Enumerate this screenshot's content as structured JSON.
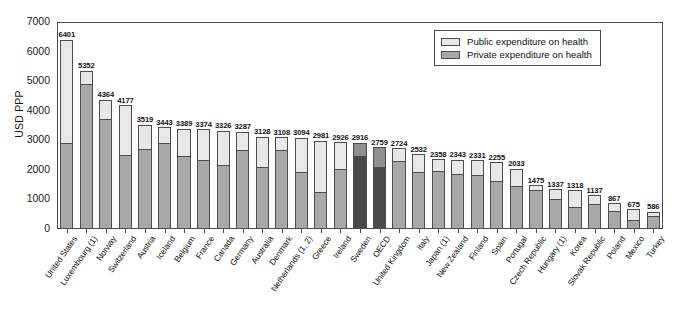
{
  "chart_data": {
    "type": "bar",
    "subtype": "stacked",
    "title": "",
    "xlabel": "",
    "ylabel": "USD PPP",
    "ylim": [
      0,
      7000
    ],
    "yticks": [
      0,
      1000,
      2000,
      3000,
      4000,
      5000,
      6000,
      7000
    ],
    "ytick_labels": [
      "0",
      "1000",
      "2000",
      "3000",
      "4000",
      "5000",
      "6000",
      "7000"
    ],
    "grid": false,
    "legend_position": "top-right",
    "legend": [
      "Public expenditure on health",
      "Private expenditure on health"
    ],
    "colors": {
      "public": "#e8e8e8",
      "private": "#a8a8a8",
      "public_highlight": "#8f8f8f",
      "private_highlight": "#4a4a4a",
      "outline": "#4d4d4d"
    },
    "highlighted_categories": [
      "Sweden",
      "OECD"
    ],
    "categories": [
      "United States",
      "Luxembourg (1)",
      "Norway",
      "Switzerland",
      "Austria",
      "Iceland",
      "Belgium",
      "France",
      "Canada",
      "Germany",
      "Australia",
      "Denmark",
      "Netherlands (1, 2)",
      "Greece",
      "Ireland",
      "Sweden",
      "OECD",
      "United Kingdom",
      "Italy",
      "Japan (1)",
      "New Zealand",
      "Finland",
      "Spain",
      "Portugal",
      "Czech Republic",
      "Hungary (1)",
      "Korea",
      "Slovak Republic",
      "Poland",
      "Mexico",
      "Turkey"
    ],
    "totals": [
      6401,
      5352,
      4364,
      4177,
      3519,
      3443,
      3389,
      3374,
      3326,
      3287,
      3128,
      3108,
      3094,
      2981,
      2926,
      2916,
      2759,
      2724,
      2532,
      2358,
      2343,
      2331,
      2255,
      2033,
      1475,
      1337,
      1318,
      1137,
      867,
      675,
      586
    ],
    "series": [
      {
        "name": "Private expenditure on health",
        "values": [
          2891,
          4867,
          3683,
          2458,
          2671,
          2865,
          2428,
          2311,
          2130,
          2646,
          2053,
          2635,
          1905,
          1204,
          1999,
          2430,
          2066,
          2265,
          1910,
          1925,
          1834,
          1790,
          1576,
          1432,
          1299,
          980,
          709,
          800,
          586,
          279,
          411
        ]
      },
      {
        "name": "Public expenditure on health",
        "values": [
          3510,
          485,
          681,
          1719,
          848,
          578,
          961,
          1063,
          1196,
          641,
          1075,
          473,
          1189,
          1777,
          927,
          486,
          693,
          459,
          622,
          433,
          509,
          541,
          679,
          601,
          176,
          357,
          609,
          337,
          281,
          396,
          175
        ]
      }
    ]
  },
  "legend": {
    "public_label": "Public expenditure on health",
    "private_label": "Private expenditure on health"
  },
  "axis": {
    "y_title": "USD PPP"
  }
}
